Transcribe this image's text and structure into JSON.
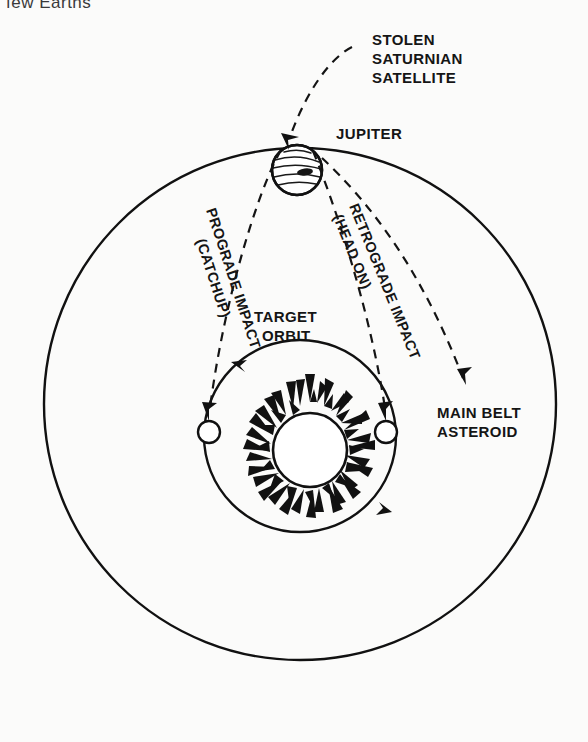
{
  "page": {
    "background_color": "#fbfbfa",
    "ink_color": "#111111",
    "width": 588,
    "height": 742,
    "cropped_caption_fragment": "few Earths"
  },
  "diagram": {
    "labels": {
      "stolen_satellite": "STOLEN\nSATURNIAN\nSATELLITE",
      "stolen_satellite_lines": [
        "STOLEN",
        "SATURNIAN",
        "SATELLITE"
      ],
      "jupiter": "JUPITER",
      "prograde": "PROGRADE IMPACT",
      "prograde_sub": "(CATCHUP)",
      "retrograde": "RETROGRADE",
      "retrograde_sub": "IMPACT",
      "retrograde_sub2": "(HEAD ON)",
      "retrograde_lines": [
        "RETROGRADE IMPACT",
        "(HEAD ON)"
      ],
      "target_orbit_lines": [
        "TARGET",
        "ORBIT"
      ],
      "main_belt_lines": [
        "MAIN BELT",
        "ASTEROID"
      ]
    },
    "bodies": [
      {
        "name": "jupiter",
        "cx": 297,
        "cy": 170,
        "r": 25,
        "style": "banded-planet"
      },
      {
        "name": "sun",
        "cx": 310,
        "cy": 450,
        "r": 37,
        "style": "spiky-sun"
      },
      {
        "name": "target-planet-left",
        "cx": 209,
        "cy": 432,
        "r": 11,
        "style": "open-circle"
      },
      {
        "name": "target-planet-right",
        "cx": 386,
        "cy": 432,
        "r": 11,
        "style": "open-circle"
      }
    ],
    "orbits": [
      {
        "name": "jupiter-orbit",
        "cx": 300,
        "cy": 404,
        "r": 256,
        "kind": "solid"
      },
      {
        "name": "target-orbit",
        "cx": 300,
        "cy": 436,
        "r": 96,
        "kind": "solid",
        "direction": "counterclockwise"
      }
    ],
    "trajectories": [
      {
        "name": "prograde-impact-path",
        "kind": "dashed",
        "from": "jupiter",
        "to": "target-planet-left"
      },
      {
        "name": "retrograde-impact-path",
        "kind": "dashed",
        "from": "jupiter",
        "to": "target-planet-right"
      },
      {
        "name": "incoming-satellite-path",
        "kind": "dashed",
        "from": "stolen-saturnian-satellite",
        "to": "jupiter"
      },
      {
        "name": "main-belt-asteroid-path",
        "kind": "dashed",
        "from": "jupiter",
        "to": "main-belt-asteroid"
      }
    ]
  }
}
